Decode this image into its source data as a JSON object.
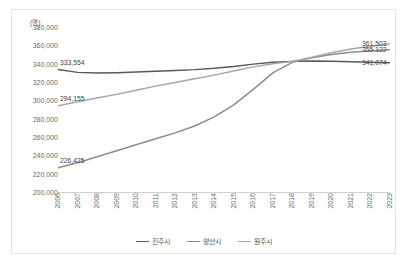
{
  "unit_label": "(명)",
  "axis": {
    "y_ticks": [
      "380,000",
      "360,000",
      "340,000",
      "320,000",
      "300,000",
      "280,000",
      "260,000",
      "240,000",
      "220,000",
      "200,000"
    ],
    "y_min": 200000,
    "y_max": 380000,
    "y_step": 20000,
    "x_ticks": [
      "2006",
      "2007",
      "2008",
      "2009",
      "2010",
      "2011",
      "2012",
      "2013",
      "2014",
      "2015",
      "2016",
      "2017",
      "2018",
      "2019",
      "2020",
      "2021",
      "2022",
      "2023"
    ]
  },
  "legend": {
    "position": "bottom",
    "items": [
      {
        "label": "진주시",
        "color": "#595959"
      },
      {
        "label": "양산시",
        "color": "#8c8c8c"
      },
      {
        "label": "원주시",
        "color": "#a6a6a6"
      }
    ]
  },
  "data_labels": {
    "left": [
      {
        "value": "333,554",
        "series": "진주시"
      },
      {
        "value": "294,155",
        "series": "원주시"
      },
      {
        "value": "226,425",
        "series": "양산시"
      }
    ],
    "right": [
      {
        "value": "361,503",
        "series": "원주시"
      },
      {
        "value": "355,122",
        "series": "양산시"
      },
      {
        "value": "341,074",
        "series": "진주시"
      }
    ]
  },
  "chart_data": {
    "type": "line",
    "title": "",
    "xlabel": "",
    "ylabel": "(명)",
    "ylim": [
      200000,
      380000
    ],
    "grid": false,
    "x": [
      "2006",
      "2007",
      "2008",
      "2009",
      "2010",
      "2011",
      "2012",
      "2013",
      "2014",
      "2015",
      "2016",
      "2017",
      "2018",
      "2019",
      "2020",
      "2021",
      "2022",
      "2023"
    ],
    "series": [
      {
        "name": "진주시",
        "color": "#595959",
        "values": [
          333554,
          330500,
          329800,
          330200,
          331000,
          331600,
          332500,
          333500,
          335000,
          337000,
          339500,
          341500,
          342500,
          342800,
          342600,
          342200,
          341600,
          341074
        ],
        "start_label": "333,554",
        "end_label": "341,074"
      },
      {
        "name": "양산시",
        "color": "#8c8c8c",
        "values": [
          226425,
          232000,
          238500,
          245000,
          251500,
          258000,
          264500,
          272000,
          282000,
          295000,
          312000,
          330000,
          341500,
          346500,
          350000,
          352500,
          354000,
          355122
        ],
        "start_label": "226,425",
        "end_label": "355,122"
      },
      {
        "name": "원주시",
        "color": "#a6a6a6",
        "values": [
          294155,
          298500,
          302500,
          306500,
          311000,
          315500,
          319500,
          323500,
          327500,
          332000,
          336500,
          340000,
          342500,
          347000,
          352000,
          356000,
          359000,
          361503
        ],
        "start_label": "294,155",
        "end_label": "361,503"
      }
    ]
  }
}
